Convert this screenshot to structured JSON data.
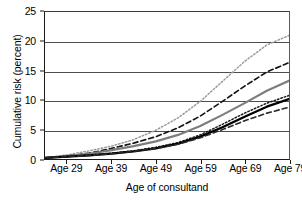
{
  "chart_data": {
    "type": "line",
    "title": "",
    "xlabel": "Age of consultand",
    "ylabel": "Cumulative risk (percent)",
    "xlim": [
      24,
      79
    ],
    "ylim": [
      0,
      25
    ],
    "grid": true,
    "legend": "none",
    "x_tick_labels": [
      "Age 29",
      "Age 39",
      "Age 49",
      "Age 59",
      "Age 69",
      "Age 79"
    ],
    "x_tick_values": [
      29,
      39,
      49,
      59,
      69,
      79
    ],
    "y_tick_labels": [
      "0",
      "5",
      "10",
      "15",
      "20",
      "25"
    ],
    "y_tick_values": [
      0,
      5,
      10,
      15,
      20,
      25
    ],
    "x": [
      24,
      29,
      34,
      39,
      44,
      49,
      54,
      59,
      64,
      69,
      74,
      79
    ],
    "series": [
      {
        "name": "series-1-highest",
        "style": "dotted",
        "color": "#9a9a9a",
        "width": 1.5,
        "values": [
          0.2,
          0.7,
          1.4,
          2.2,
          3.3,
          4.9,
          7.0,
          9.8,
          13.2,
          16.6,
          19.4,
          21.0
        ]
      },
      {
        "name": "series-2",
        "style": "dashed",
        "color": "#141414",
        "width": 1.7,
        "values": [
          0.2,
          0.5,
          1.0,
          1.8,
          2.7,
          3.8,
          5.3,
          7.3,
          9.8,
          12.4,
          14.8,
          16.4
        ]
      },
      {
        "name": "series-3",
        "style": "solid",
        "color": "#7d7d7d",
        "width": 2.2,
        "values": [
          0.2,
          0.5,
          0.9,
          1.5,
          2.2,
          3.0,
          4.1,
          5.6,
          7.5,
          9.5,
          11.6,
          13.3
        ]
      },
      {
        "name": "series-4",
        "style": "dotted",
        "color": "#1a1a1a",
        "width": 1.5,
        "values": [
          0.2,
          0.4,
          0.7,
          1.0,
          1.4,
          2.0,
          2.8,
          4.1,
          5.9,
          7.8,
          9.5,
          10.8
        ]
      },
      {
        "name": "series-5",
        "style": "solid",
        "color": "#000000",
        "width": 2.3,
        "values": [
          0.2,
          0.4,
          0.6,
          0.9,
          1.3,
          1.8,
          2.6,
          3.8,
          5.4,
          7.2,
          8.9,
          10.2
        ]
      },
      {
        "name": "series-6-lowest",
        "style": "dashed",
        "color": "#2a2a2a",
        "width": 1.6,
        "values": [
          0.2,
          0.4,
          0.6,
          0.9,
          1.3,
          1.8,
          2.5,
          3.6,
          5.0,
          6.5,
          7.8,
          8.8
        ]
      }
    ]
  }
}
